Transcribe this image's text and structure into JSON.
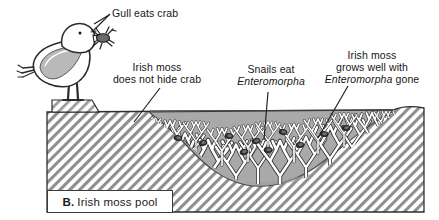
{
  "figure": {
    "caption_prefix": "B.",
    "caption_text": "Irish moss pool",
    "colors": {
      "pool_water": "#a8a8a8",
      "rock_hatch": "#8c8c8c",
      "ink": "#1a1a1a",
      "paper": "#ffffff",
      "seaweed_fill": "#ffffff"
    }
  },
  "labels": {
    "gull": "Gull eats crab",
    "hide_line1": "Irish moss",
    "hide_line2": "does not hide crab",
    "snails_line1": "Snails eat",
    "snails_line2": "Enteromorpha",
    "grows_line1": "Irish moss",
    "grows_line2": "grows well with",
    "grows_line3a": "Enteromorpha",
    "grows_line3b": " gone"
  },
  "scene": {
    "gull_name": "gull-standing-on-rock",
    "crab_in_beak": "crab",
    "pool_name": "tide-pool-water",
    "seaweed_name": "irish-moss-seaweed-clumps",
    "snail_name": "snails-on-seaweed",
    "rock_name": "hatched-rock-substrate"
  }
}
